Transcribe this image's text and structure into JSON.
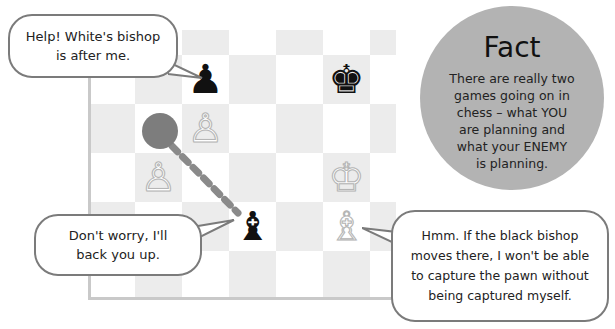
{
  "board": {
    "colors": {
      "dark_square": "#ececec",
      "light_square": "#ffffff",
      "marker": "#7d7d7d"
    },
    "pieces": [
      {
        "name": "black-pawn",
        "glyph": "♟",
        "color": "black",
        "col": 2,
        "row": 1
      },
      {
        "name": "black-king",
        "glyph": "♚",
        "color": "black",
        "col": 5,
        "row": 1
      },
      {
        "name": "white-pawn",
        "glyph": "♙",
        "color": "white",
        "col": 2,
        "row": 2
      },
      {
        "name": "white-pawn",
        "glyph": "♙",
        "color": "white",
        "col": 1,
        "row": 3
      },
      {
        "name": "white-king",
        "glyph": "♔",
        "color": "white",
        "col": 5,
        "row": 3
      },
      {
        "name": "black-bishop",
        "glyph": "♝",
        "color": "black",
        "col": 3,
        "row": 4
      },
      {
        "name": "white-bishop",
        "glyph": "♗",
        "color": "white",
        "col": 5,
        "row": 4
      }
    ],
    "move_marker": {
      "col": 1,
      "row": 2,
      "target": "black-bishop"
    }
  },
  "bubbles": {
    "pawn_speech": "Help! White's bishop\nis after me.",
    "bishop_speech": "Don't worry, I'll\nback you up.",
    "white_bishop_speech": "Hmm. If the black bishop\nmoves there, I won't be able\nto capture the pawn without\nbeing captured myself."
  },
  "fact": {
    "title": "Fact",
    "body": "There are really two\ngames going on in\nchess – what YOU\nare planning and\nwhat your ENEMY\nis planning.",
    "color": "#b3b3b3"
  }
}
